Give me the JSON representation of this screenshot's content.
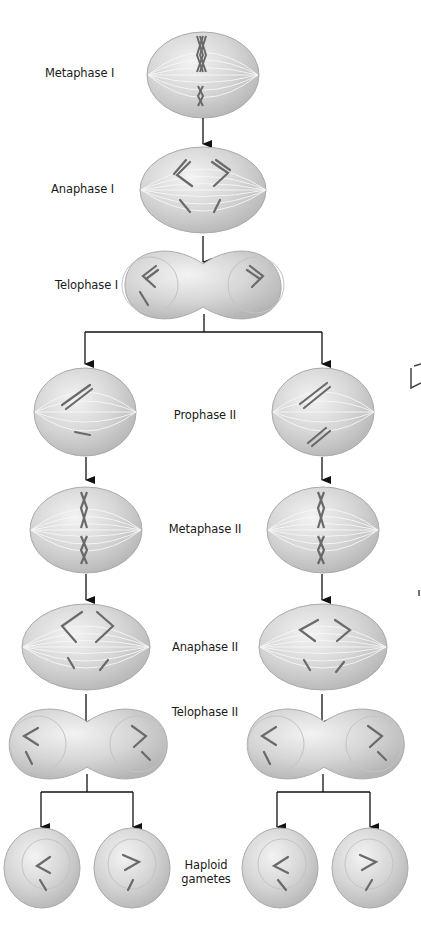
{
  "figure": {
    "stages": [
      {
        "id": "metaphase-1",
        "label": "Metaphase I"
      },
      {
        "id": "anaphase-1",
        "label": "Anaphase I"
      },
      {
        "id": "telophase-1",
        "label": "Telophase I"
      },
      {
        "id": "prophase-2",
        "label": "Prophase II"
      },
      {
        "id": "metaphase-2",
        "label": "Metaphase II"
      },
      {
        "id": "anaphase-2",
        "label": "Anaphase II"
      },
      {
        "id": "telophase-2",
        "label": "Telophase II"
      },
      {
        "id": "haploid-gametes",
        "label_line1": "Haploid",
        "label_line2": "gametes"
      }
    ],
    "colors": {
      "background": "#ffffff",
      "cell_fill": "#d4d4d4",
      "cell_highlight": "#f2f2f2",
      "cell_edge": "#a8a8a8",
      "spindle": "#f7f7f7",
      "chromosome": "#6e6e6e",
      "arrow": "#111111",
      "text": "#1a1a1a"
    }
  }
}
